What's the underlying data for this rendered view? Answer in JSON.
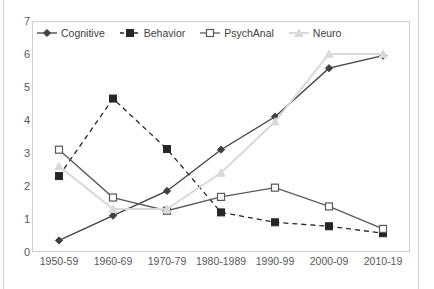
{
  "chart_data": {
    "type": "line",
    "title": "",
    "xlabel": "",
    "ylabel": "",
    "ylim": [
      0,
      7
    ],
    "ytick_values": [
      0,
      1,
      2,
      3,
      4,
      5,
      6,
      7
    ],
    "grid": false,
    "legend_position": "top-left",
    "categories": [
      "1950-59",
      "1960-69",
      "1970-79",
      "1980-1989",
      "1990-99",
      "2000-09",
      "2010-19"
    ],
    "series": [
      {
        "name": "Cognitive",
        "marker": "filled-diamond",
        "line_style": "solid",
        "color": "#404040",
        "values": [
          0.35,
          1.1,
          1.85,
          3.1,
          4.1,
          5.57,
          5.95
        ]
      },
      {
        "name": "Behavior",
        "marker": "filled-square",
        "line_style": "dashed",
        "color": "#262626",
        "values": [
          2.3,
          4.65,
          3.12,
          1.2,
          0.9,
          0.78,
          0.57
        ]
      },
      {
        "name": "PsychAnal",
        "marker": "open-square",
        "line_style": "solid",
        "color": "#595959",
        "values": [
          3.1,
          1.65,
          1.25,
          1.67,
          1.95,
          1.38,
          0.7
        ]
      },
      {
        "name": "Neuro",
        "marker": "triangle",
        "line_style": "solid",
        "color": "#d9d9d9",
        "values": [
          2.6,
          1.3,
          1.3,
          2.4,
          3.95,
          6.0,
          6.0
        ]
      }
    ]
  },
  "legend": {
    "items": [
      {
        "label": "Cognitive"
      },
      {
        "label": "Behavior"
      },
      {
        "label": "PsychAnal"
      },
      {
        "label": "Neuro"
      }
    ]
  }
}
